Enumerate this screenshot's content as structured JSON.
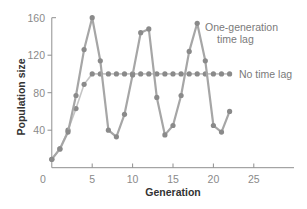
{
  "chart_data": {
    "type": "line",
    "title": "",
    "xlabel": "Generation",
    "ylabel": "Population size",
    "xlim": [
      0,
      30
    ],
    "ylim": [
      0,
      160
    ],
    "xticks": [
      0,
      5,
      10,
      15,
      20,
      25
    ],
    "yticks": [
      40,
      80,
      120,
      160
    ],
    "grid": false,
    "legend_position": "inline annotations (right)",
    "series": [
      {
        "name": "One-generation time lag",
        "style": "solid line with markers",
        "color": "#8c8c8c",
        "x": [
          0,
          1,
          2,
          3,
          4,
          5,
          6,
          7,
          8,
          9,
          10,
          11,
          12,
          13,
          14,
          15,
          16,
          17,
          18,
          19,
          20,
          21,
          22
        ],
        "values": [
          9,
          20,
          38,
          77,
          126,
          160,
          114,
          40,
          33,
          57,
          99,
          144,
          148,
          75,
          35,
          45,
          77,
          124,
          154,
          114,
          45,
          38,
          60
        ]
      },
      {
        "name": "No time lag",
        "style": "dotted markers",
        "color": "#8c8c8c",
        "x": [
          0,
          1,
          2,
          3,
          4,
          5,
          6,
          7,
          8,
          9,
          10,
          11,
          12,
          13,
          14,
          15,
          16,
          17,
          18,
          19,
          20,
          21,
          22
        ],
        "values": [
          9,
          20,
          40,
          63,
          89,
          100,
          100,
          100,
          100,
          100,
          100,
          100,
          100,
          100,
          100,
          100,
          100,
          100,
          100,
          100,
          100,
          100,
          100
        ]
      }
    ],
    "annotations": [
      {
        "text": "One-generation",
        "line2": "time lag",
        "series": "One-generation time lag"
      },
      {
        "text": "No time lag",
        "series": "No time lag"
      }
    ]
  },
  "labels": {
    "xlabel": "Generation",
    "ylabel": "Population size",
    "annot_lag_line1": "One-generation",
    "annot_lag_line2": "time lag",
    "annot_nolag": "No time lag",
    "x0": "0",
    "x5": "5",
    "x10": "10",
    "x15": "15",
    "x20": "20",
    "x25": "25",
    "y40": "40",
    "y80": "80",
    "y120": "120",
    "y160": "160"
  }
}
